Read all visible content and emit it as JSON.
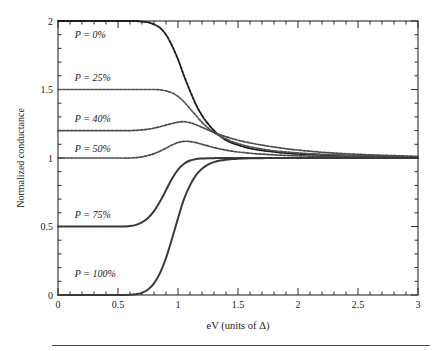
{
  "chart_data": {
    "type": "line",
    "title": "",
    "subtitle": "",
    "xlabel": "eV (units of Δ)",
    "ylabel": "Normalized conductance",
    "xlim": [
      0,
      3
    ],
    "ylim": [
      0,
      2
    ],
    "xticks": [
      0,
      0.5,
      1,
      1.5,
      2,
      2.5,
      3
    ],
    "xticklabels": [
      "0",
      "0.5",
      "1",
      "1.5",
      "2",
      "2.5",
      "3"
    ],
    "yticks": [
      0,
      0.5,
      1,
      1.5,
      2
    ],
    "yticklabels": [
      "0",
      "0.5",
      "1",
      "1.5",
      "2"
    ],
    "xminor_step": 0.1,
    "yminor_step": 0.1,
    "grid": false,
    "legend_position": "inline-annotations",
    "ticks_direction": "in",
    "frame": "box",
    "series": [
      {
        "name": "P = 0%",
        "label": "P = 0%",
        "style": "dashed-dense",
        "color": "#1c1c1c",
        "width": 1.9,
        "x": [
          0,
          0.1,
          0.2,
          0.3,
          0.4,
          0.5,
          0.6,
          0.65,
          0.7,
          0.75,
          0.8,
          0.85,
          0.9,
          0.95,
          1.0,
          1.05,
          1.1,
          1.15,
          1.2,
          1.25,
          1.3,
          1.35,
          1.4,
          1.45,
          1.5,
          1.6,
          1.7,
          1.8,
          1.9,
          2.0,
          2.2,
          2.4,
          2.6,
          2.8,
          3.0
        ],
        "y": [
          2.0,
          2.0,
          2.0,
          2.0,
          2.0,
          2.0,
          2.0,
          2.0,
          1.995,
          1.99,
          1.975,
          1.95,
          1.9,
          1.82,
          1.72,
          1.6,
          1.49,
          1.39,
          1.31,
          1.25,
          1.2,
          1.16,
          1.13,
          1.11,
          1.095,
          1.07,
          1.055,
          1.045,
          1.036,
          1.03,
          1.022,
          1.016,
          1.012,
          1.009,
          1.007
        ]
      },
      {
        "name": "P = 25%",
        "label": "P = 25%",
        "style": "dashed-dense",
        "color": "#555555",
        "width": 1.7,
        "x": [
          0,
          0.1,
          0.2,
          0.3,
          0.4,
          0.5,
          0.6,
          0.65,
          0.7,
          0.75,
          0.8,
          0.85,
          0.9,
          0.95,
          1.0,
          1.05,
          1.1,
          1.15,
          1.2,
          1.25,
          1.3,
          1.35,
          1.4,
          1.45,
          1.5,
          1.6,
          1.7,
          1.8,
          1.9,
          2.0,
          2.2,
          2.4,
          2.6,
          2.8,
          3.0
        ],
        "y": [
          1.5,
          1.5,
          1.5,
          1.5,
          1.5,
          1.5,
          1.5,
          1.5,
          1.5,
          1.5,
          1.5,
          1.498,
          1.49,
          1.475,
          1.45,
          1.41,
          1.36,
          1.31,
          1.26,
          1.22,
          1.185,
          1.16,
          1.14,
          1.12,
          1.105,
          1.082,
          1.065,
          1.053,
          1.044,
          1.037,
          1.027,
          1.02,
          1.015,
          1.011,
          1.008
        ]
      },
      {
        "name": "P = 40%",
        "label": "P = 40%",
        "style": "dashed-dense",
        "color": "#4a4a4a",
        "width": 1.7,
        "x": [
          0,
          0.1,
          0.2,
          0.3,
          0.4,
          0.5,
          0.6,
          0.65,
          0.7,
          0.75,
          0.8,
          0.85,
          0.9,
          0.95,
          1.0,
          1.05,
          1.1,
          1.15,
          1.2,
          1.25,
          1.3,
          1.35,
          1.4,
          1.45,
          1.5,
          1.6,
          1.7,
          1.8,
          1.9,
          2.0,
          2.2,
          2.4,
          2.6,
          2.8,
          3.0
        ],
        "y": [
          1.2,
          1.2,
          1.2,
          1.2,
          1.2,
          1.2,
          1.2,
          1.202,
          1.205,
          1.21,
          1.218,
          1.228,
          1.24,
          1.252,
          1.262,
          1.265,
          1.258,
          1.243,
          1.224,
          1.205,
          1.186,
          1.17,
          1.155,
          1.142,
          1.13,
          1.11,
          1.094,
          1.08,
          1.068,
          1.058,
          1.042,
          1.031,
          1.023,
          1.017,
          1.012
        ]
      },
      {
        "name": "P = 50%",
        "label": "P = 50%",
        "style": "dashed-dense",
        "color": "#4a4a4a",
        "width": 1.7,
        "x": [
          0,
          0.1,
          0.2,
          0.3,
          0.4,
          0.5,
          0.6,
          0.65,
          0.7,
          0.75,
          0.8,
          0.85,
          0.9,
          0.95,
          1.0,
          1.05,
          1.1,
          1.15,
          1.2,
          1.25,
          1.3,
          1.35,
          1.4,
          1.45,
          1.5,
          1.6,
          1.7,
          1.8,
          1.9,
          2.0,
          2.2,
          2.4,
          2.6,
          2.8,
          3.0
        ],
        "y": [
          1.0,
          1.0,
          1.0,
          1.0,
          1.0,
          1.0,
          1.0,
          1.003,
          1.008,
          1.018,
          1.032,
          1.05,
          1.072,
          1.095,
          1.113,
          1.122,
          1.12,
          1.112,
          1.1,
          1.088,
          1.076,
          1.066,
          1.057,
          1.05,
          1.044,
          1.035,
          1.028,
          1.023,
          1.019,
          1.016,
          1.012,
          1.009,
          1.007,
          1.005,
          1.004
        ]
      },
      {
        "name": "P = 75%",
        "label": "P = 75%",
        "style": "solid",
        "color": "#3a3a3a",
        "width": 2.0,
        "x": [
          0,
          0.1,
          0.2,
          0.3,
          0.4,
          0.5,
          0.55,
          0.6,
          0.65,
          0.7,
          0.75,
          0.8,
          0.85,
          0.9,
          0.95,
          1.0,
          1.05,
          1.1,
          1.15,
          1.2,
          1.25,
          1.3,
          1.35,
          1.4,
          1.45,
          1.5,
          1.6,
          1.7,
          1.8,
          1.9,
          2.0,
          2.2,
          2.4,
          2.6,
          2.8,
          3.0
        ],
        "y": [
          0.5,
          0.5,
          0.5,
          0.5,
          0.5,
          0.5,
          0.5,
          0.503,
          0.512,
          0.53,
          0.562,
          0.612,
          0.682,
          0.765,
          0.848,
          0.915,
          0.958,
          0.982,
          0.992,
          0.996,
          0.998,
          0.999,
          1.0,
          1.0,
          1.0,
          1.0,
          1.0,
          1.0,
          1.0,
          1.0,
          1.0,
          1.0,
          1.0,
          1.0,
          1.0,
          1.0
        ]
      },
      {
        "name": "P = 100%",
        "label": "P = 100%",
        "style": "solid",
        "color": "#3a3a3a",
        "width": 2.0,
        "x": [
          0,
          0.1,
          0.2,
          0.3,
          0.4,
          0.5,
          0.6,
          0.65,
          0.7,
          0.75,
          0.8,
          0.85,
          0.9,
          0.95,
          1.0,
          1.05,
          1.1,
          1.15,
          1.2,
          1.25,
          1.3,
          1.35,
          1.4,
          1.45,
          1.5,
          1.6,
          1.7,
          1.8,
          1.9,
          2.0,
          2.2,
          2.4,
          2.6,
          2.8,
          3.0
        ],
        "y": [
          0.0,
          0.0,
          0.0,
          0.0,
          0.0,
          0.0,
          0.002,
          0.006,
          0.016,
          0.04,
          0.085,
          0.16,
          0.27,
          0.41,
          0.56,
          0.7,
          0.8,
          0.875,
          0.922,
          0.952,
          0.97,
          0.981,
          0.988,
          0.992,
          0.995,
          0.998,
          0.999,
          1.0,
          1.0,
          1.0,
          1.0,
          1.0,
          1.0,
          1.0,
          1.0
        ]
      }
    ],
    "annotations": [
      {
        "text": "P = 0%",
        "x": 0.14,
        "y": 1.875
      },
      {
        "text": "P = 25%",
        "x": 0.14,
        "y": 1.565
      },
      {
        "text": "P = 40%",
        "x": 0.14,
        "y": 1.26
      },
      {
        "text": "P = 50%",
        "x": 0.14,
        "y": 1.045
      },
      {
        "text": "P = 75%",
        "x": 0.14,
        "y": 0.565
      },
      {
        "text": "P = 100%",
        "x": 0.14,
        "y": 0.135
      }
    ]
  }
}
